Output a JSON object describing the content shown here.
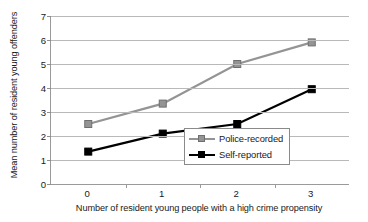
{
  "chart_data": {
    "type": "line",
    "title": "",
    "xlabel": "Number of resident young people with a high crime propensity",
    "ylabel": "Mean number of resident young offenders",
    "categories": [
      "0",
      "1",
      "2",
      "3"
    ],
    "ylim": [
      0,
      7
    ],
    "yticks": [
      "0",
      "1",
      "2",
      "3",
      "4",
      "5",
      "6",
      "7"
    ],
    "grid": true,
    "legend_position": "inside lower-right",
    "series": [
      {
        "name": "Police-recorded",
        "color": "#949494",
        "marker": "square",
        "values": [
          2.5,
          3.35,
          5.0,
          5.9
        ]
      },
      {
        "name": "Self-reported",
        "color": "#000000",
        "marker": "square",
        "values": [
          1.35,
          2.1,
          2.5,
          3.95
        ]
      }
    ]
  },
  "axes": {
    "axis_line_color": "#9a9a9a",
    "gridline_color": "#b9b9b9",
    "background": "#ffffff"
  }
}
